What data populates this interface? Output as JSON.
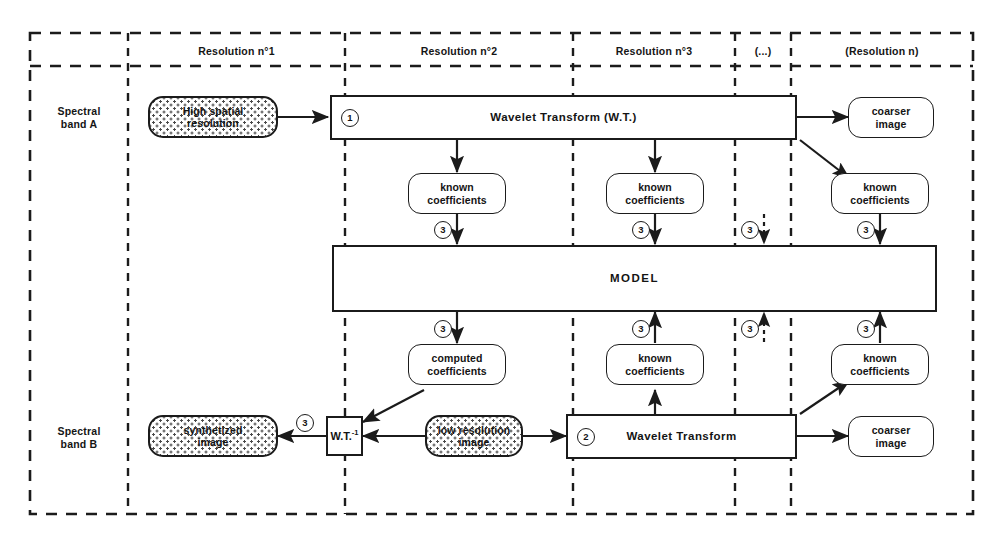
{
  "figure": {
    "ink_color": "#1b1b1b",
    "background": "#ffffff"
  },
  "columns": [
    {
      "id": "bands",
      "label": ""
    },
    {
      "id": "res1",
      "label": "Resolution n°1"
    },
    {
      "id": "res2",
      "label": "Resolution n°2"
    },
    {
      "id": "res3",
      "label": "Resolution n°3"
    },
    {
      "id": "dots",
      "label": "(...)"
    },
    {
      "id": "resn",
      "label": "(Resolution n)"
    }
  ],
  "bands": [
    {
      "id": "a",
      "label": "Spectral\nband A"
    },
    {
      "id": "b",
      "label": "Spectral\nband B"
    }
  ],
  "band_a_label_line1": "Spectral",
  "band_a_label_line2": "band A",
  "band_b_label_line1": "Spectral",
  "band_b_label_line2": "band B",
  "nodes": {
    "high_res_line1": "High spatial",
    "high_res_line2": "resolution",
    "wt_top": "Wavelet Transform (W.T.)",
    "coarser_top_line1": "coarser",
    "coarser_top_line2": "image",
    "known_top_res2_line1": "known",
    "known_top_res2_line2": "coefficients",
    "known_top_res3_line1": "known",
    "known_top_res3_line2": "coefficients",
    "known_top_resn_line1": "known",
    "known_top_resn_line2": "coefficients",
    "model": "MODEL",
    "computed_res2_line1": "computed",
    "computed_res2_line2": "coefficients",
    "known_bot_res3_line1": "known",
    "known_bot_res3_line2": "coefficients",
    "known_bot_resn_line1": "known",
    "known_bot_resn_line2": "coefficients",
    "synth_line1": "synthetized",
    "synth_line2": "image",
    "wt_inverse": "W.T.",
    "wt_inverse_exp": "-1",
    "low_res_line1": "low resolution",
    "low_res_line2": "image",
    "wt_bottom": "Wavelet Transform",
    "coarser_bot_line1": "coarser",
    "coarser_bot_line2": "image"
  },
  "markers": {
    "m_wt_top": "1",
    "m_up_res2": "3",
    "m_up_res3": "3",
    "m_up_dots": "3",
    "m_up_resn": "3",
    "m_dn_res2": "3",
    "m_dn_res3": "3",
    "m_dn_dots": "3",
    "m_dn_resn": "3",
    "m_synth": "3",
    "m_wt_bottom": "2"
  }
}
